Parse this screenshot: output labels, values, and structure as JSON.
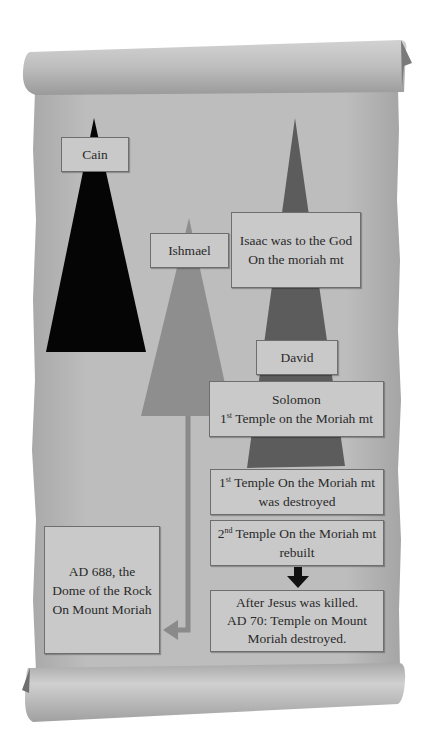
{
  "diagram": {
    "colors": {
      "paper": "#bcbcbc",
      "cain_triangle": "#050505",
      "ishmael_triangle": "#8e8e8e",
      "isaac_triangle": "#5c5c5c",
      "box_fill": "#c9c9c9",
      "box_border": "#6e6e6e",
      "arrow_gray": "#8a8a8a",
      "arrow_black": "#111111"
    },
    "nodes": {
      "cain": {
        "label": "Cain"
      },
      "ishmael": {
        "label": "Ishmael"
      },
      "isaac": {
        "line1": "Isaac was to the God",
        "line2": "On the moriah mt"
      },
      "david": {
        "label": "David"
      },
      "solomon": {
        "line1": "Solomon",
        "line2_ord_num": "1",
        "line2_ord_sup": "st",
        "line2_rest": " Temple on the Moriah mt"
      },
      "first_temple_destroyed": {
        "ord_num": "1",
        "ord_sup": "st",
        "line1_rest": " Temple On the Moriah mt",
        "line2": "was destroyed"
      },
      "second_temple_rebuilt": {
        "ord_num": "2",
        "ord_sup": "nd",
        "line1_rest": " Temple On the Moriah mt",
        "line2": "rebuilt"
      },
      "ad70": {
        "line1": "After Jesus was killed.",
        "line2": "AD 70: Temple on Mount",
        "line3": "Moriah destroyed."
      },
      "dome": {
        "line1": "AD 688, the",
        "line2": "Dome of the Rock",
        "line3": "On Mount Moriah"
      }
    },
    "arrows": [
      {
        "from": "ishmael",
        "to": "dome",
        "style": "gray-elbow"
      },
      {
        "from": "second_temple_rebuilt",
        "to": "ad70",
        "style": "black-down"
      }
    ]
  }
}
